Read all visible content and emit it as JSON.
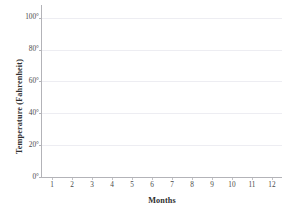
{
  "chart_data": {
    "type": "line",
    "title": "",
    "title_note": "cropped-illegible",
    "xlabel": "Months",
    "ylabel": "Temperature (Fahrenheit)",
    "x": [
      1,
      2,
      3,
      4,
      5,
      6,
      7,
      8,
      9,
      10,
      11,
      12
    ],
    "xtick_labels": [
      "1",
      "2",
      "3",
      "4",
      "5",
      "6",
      "7",
      "8",
      "9",
      "10",
      "11",
      "12"
    ],
    "ytick_values": [
      0,
      20,
      40,
      60,
      80,
      100
    ],
    "ytick_labels": [
      "0°",
      "20°",
      "40°",
      "60°",
      "80°",
      "100°"
    ],
    "xlim": [
      0.5,
      12.5
    ],
    "ylim": [
      0,
      108
    ],
    "grid": true,
    "grid_axis": "y",
    "legend": false,
    "series": [],
    "annotations": [],
    "empty_plot": true,
    "colors": {
      "background": "#ffffff",
      "axis": "#b3b3b8",
      "gridline": "#ededf2",
      "tick_label": "#4a4a4a",
      "axis_title": "#2e2e2e"
    }
  }
}
